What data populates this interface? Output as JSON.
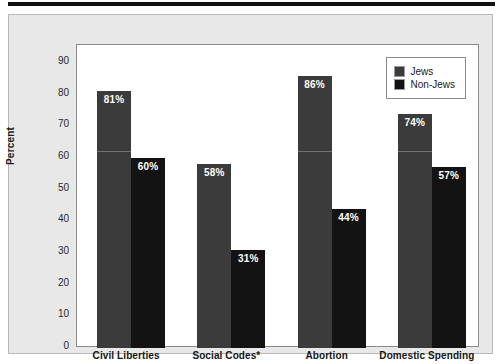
{
  "chart_data": {
    "type": "bar",
    "title": "",
    "xlabel": "",
    "ylabel": "Percent",
    "ylim": [
      0,
      95
    ],
    "yticks": [
      0,
      10,
      20,
      30,
      40,
      50,
      60,
      70,
      80,
      90
    ],
    "ytick_labels": [
      "0",
      "10",
      "20",
      "30",
      "40",
      "50",
      "60",
      "70",
      "80",
      "90"
    ],
    "grid": false,
    "legend_position": "top-right",
    "categories": [
      "Civil Liberties",
      "Social Codes*",
      "Abortion",
      "Domestic Spending"
    ],
    "series": [
      {
        "name": "Jews",
        "color": "#3b3b3b",
        "values": [
          81,
          58,
          86,
          74
        ],
        "labels": [
          "81%",
          "58%",
          "86%",
          "74%"
        ]
      },
      {
        "name": "Non-Jews",
        "color": "#131313",
        "values": [
          60,
          31,
          44,
          57
        ],
        "labels": [
          "60%",
          "31%",
          "44%",
          "57%"
        ]
      }
    ]
  },
  "legend": {
    "items": [
      {
        "label": "Jews",
        "color": "#3b3b3b"
      },
      {
        "label": "Non-Jews",
        "color": "#131313"
      }
    ]
  },
  "axis": {
    "y_title": "Percent"
  }
}
